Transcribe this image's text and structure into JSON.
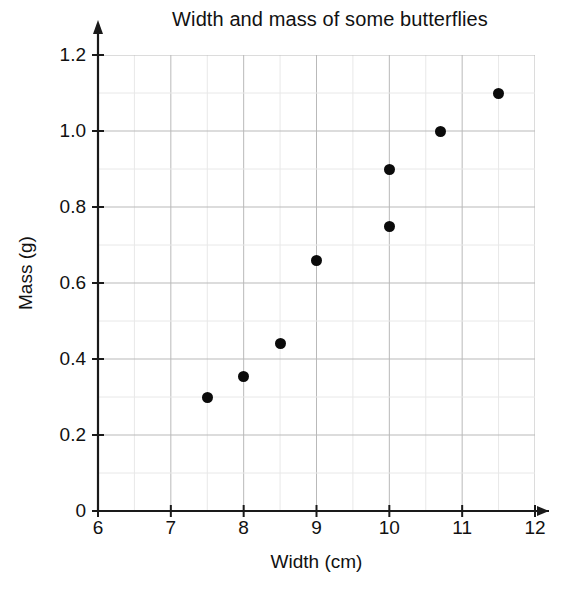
{
  "chart_data": {
    "type": "scatter",
    "title": "Width and mass of some butterflies",
    "xlabel": "Width (cm)",
    "ylabel": "Mass (g)",
    "xlim": [
      6,
      12
    ],
    "ylim": [
      0,
      1.2
    ],
    "xticks": [
      "6",
      "7",
      "8",
      "9",
      "10",
      "11",
      "12"
    ],
    "xtick_values": [
      6,
      7,
      8,
      9,
      10,
      11,
      12
    ],
    "yticks": [
      "0",
      "0.2",
      "0.4",
      "0.6",
      "0.8",
      "1.0",
      "1.2"
    ],
    "ytick_values": [
      0,
      0.2,
      0.4,
      0.6,
      0.8,
      1.0,
      1.2
    ],
    "x_minor_step": 0.5,
    "y_minor_step": 0.1,
    "grid": true,
    "legend": "none",
    "marker_color": "#0b0b0b",
    "major_grid_color": "#b9b9b9",
    "minor_grid_color": "#e8e8e8",
    "axis_color": "#1a1a1a",
    "points": [
      {
        "x": 7.5,
        "y": 0.3
      },
      {
        "x": 8.0,
        "y": 0.355
      },
      {
        "x": 8.5,
        "y": 0.44
      },
      {
        "x": 9.0,
        "y": 0.66
      },
      {
        "x": 10.0,
        "y": 0.75
      },
      {
        "x": 10.0,
        "y": 0.9
      },
      {
        "x": 10.7,
        "y": 1.0
      },
      {
        "x": 11.5,
        "y": 1.1
      }
    ]
  }
}
